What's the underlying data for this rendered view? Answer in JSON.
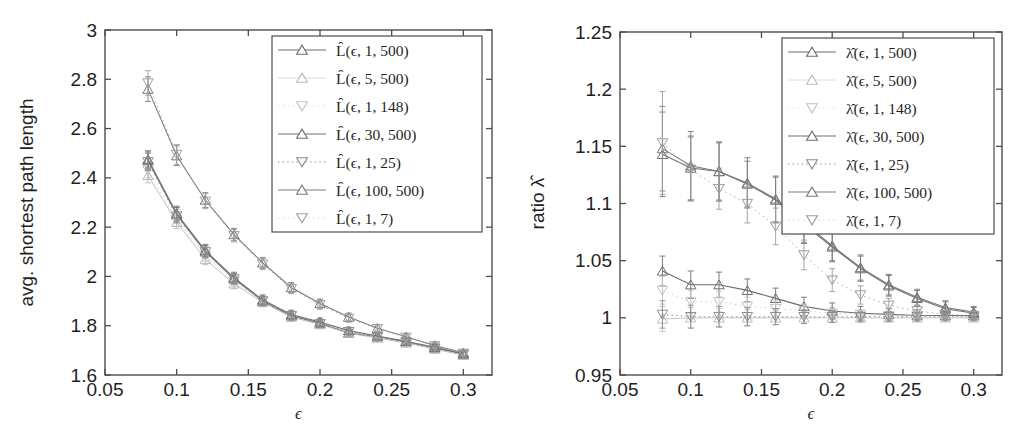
{
  "figure": {
    "panel_count": 2,
    "background": "#ffffff",
    "x_axis_symbol": "ϵ"
  },
  "chart_data": [
    {
      "type": "line",
      "panel": "left",
      "title": "",
      "xlabel": "ϵ",
      "ylabel": "avg. shortest path length",
      "xlim": [
        0.05,
        0.32
      ],
      "ylim": [
        1.6,
        3.0
      ],
      "xticks": [
        0.05,
        0.1,
        0.15,
        0.2,
        0.25,
        0.3
      ],
      "xticklabels": [
        "0.05",
        "0.1",
        "0.15",
        "0.2",
        "0.25",
        "0.3"
      ],
      "yticks": [
        1.6,
        1.8,
        2.0,
        2.2,
        2.4,
        2.6,
        2.8,
        3.0
      ],
      "yticklabels": [
        "1.6",
        "1.8",
        "2",
        "2.2",
        "2.4",
        "2.6",
        "2.8",
        "3"
      ],
      "grid": false,
      "legend_position": "upper-right",
      "errorbars": true,
      "x": [
        0.08,
        0.1,
        0.12,
        0.14,
        0.16,
        0.18,
        0.2,
        0.22,
        0.24,
        0.26,
        0.28,
        0.3
      ],
      "series": [
        {
          "name": "L̂(ϵ, 1, 500)",
          "marker": "triangle-up",
          "linestyle": "solid",
          "color": "#6e6e6e",
          "values": [
            2.47,
            2.25,
            2.1,
            1.99,
            1.9,
            1.84,
            1.81,
            1.77,
            1.755,
            1.735,
            1.71,
            1.685
          ],
          "errors": [
            0.035,
            0.03,
            0.025,
            0.022,
            0.02,
            0.018,
            0.016,
            0.014,
            0.013,
            0.012,
            0.011,
            0.01
          ]
        },
        {
          "name": "L̂(ϵ, 5, 500)",
          "marker": "triangle-up",
          "linestyle": "solid-faint",
          "color": "#b9b9b9",
          "values": [
            2.41,
            2.22,
            2.07,
            1.97,
            1.895,
            1.835,
            1.805,
            1.77,
            1.75,
            1.73,
            1.705,
            1.68
          ],
          "errors": [
            0.03,
            0.026,
            0.022,
            0.02,
            0.018,
            0.016,
            0.014,
            0.013,
            0.012,
            0.011,
            0.01,
            0.009
          ]
        },
        {
          "name": "L̂(ϵ, 1, 148)",
          "marker": "triangle-down",
          "linestyle": "dotted-faint",
          "color": "#c2c2c2",
          "values": [
            2.43,
            2.23,
            2.085,
            1.98,
            1.9,
            1.84,
            1.805,
            1.775,
            1.752,
            1.732,
            1.708,
            1.683
          ],
          "errors": [
            0.03,
            0.026,
            0.022,
            0.02,
            0.018,
            0.016,
            0.014,
            0.013,
            0.012,
            0.011,
            0.01,
            0.009
          ]
        },
        {
          "name": "L̂(ϵ, 30, 500)",
          "marker": "triangle-up",
          "linestyle": "solid",
          "color": "#707070",
          "values": [
            2.475,
            2.255,
            2.105,
            1.995,
            1.905,
            1.845,
            1.815,
            1.78,
            1.758,
            1.737,
            1.712,
            1.687
          ],
          "errors": [
            0.035,
            0.03,
            0.025,
            0.022,
            0.02,
            0.018,
            0.016,
            0.014,
            0.013,
            0.012,
            0.011,
            0.01
          ]
        },
        {
          "name": "L̂(ϵ, 1, 25)",
          "marker": "triangle-down",
          "linestyle": "dotted",
          "color": "#8c8c8c",
          "values": [
            2.465,
            2.245,
            2.1,
            1.99,
            1.9,
            1.84,
            1.808,
            1.776,
            1.754,
            1.734,
            1.709,
            1.684
          ],
          "errors": [
            0.035,
            0.028,
            0.024,
            0.021,
            0.019,
            0.017,
            0.015,
            0.014,
            0.012,
            0.011,
            0.01,
            0.009
          ]
        },
        {
          "name": "L̂(ϵ, 100, 500)",
          "marker": "triangle-up",
          "linestyle": "solid",
          "color": "#7a7a7a",
          "values": [
            2.76,
            2.49,
            2.31,
            2.17,
            2.055,
            1.955,
            1.89,
            1.835,
            1.79,
            1.755,
            1.72,
            1.69
          ],
          "errors": [
            0.05,
            0.04,
            0.03,
            0.025,
            0.022,
            0.02,
            0.018,
            0.016,
            0.014,
            0.012,
            0.011,
            0.01
          ]
        },
        {
          "name": "L̂(ϵ, 1, 7)",
          "marker": "triangle-down",
          "linestyle": "dotted-faint",
          "color": "#a0a0a0",
          "values": [
            2.785,
            2.495,
            2.305,
            2.165,
            2.05,
            1.95,
            1.885,
            1.83,
            1.788,
            1.753,
            1.718,
            1.688
          ],
          "errors": [
            0.05,
            0.04,
            0.03,
            0.025,
            0.022,
            0.02,
            0.018,
            0.016,
            0.014,
            0.012,
            0.011,
            0.01
          ]
        }
      ]
    },
    {
      "type": "line",
      "panel": "right",
      "title": "",
      "xlabel": "ϵ",
      "ylabel": "ratio λ̂",
      "xlim": [
        0.05,
        0.32
      ],
      "ylim": [
        0.95,
        1.25
      ],
      "xticks": [
        0.05,
        0.1,
        0.15,
        0.2,
        0.25,
        0.3
      ],
      "xticklabels": [
        "0.05",
        "0.1",
        "0.15",
        "0.2",
        "0.25",
        "0.3"
      ],
      "yticks": [
        0.95,
        1.0,
        1.05,
        1.1,
        1.15,
        1.2,
        1.25
      ],
      "yticklabels": [
        "0.95",
        "1",
        "1.05",
        "1.1",
        "1.15",
        "1.2",
        "1.25"
      ],
      "grid": false,
      "legend_position": "upper-right",
      "errorbars": true,
      "x": [
        0.08,
        0.1,
        0.12,
        0.14,
        0.16,
        0.18,
        0.2,
        0.22,
        0.24,
        0.26,
        0.28,
        0.3
      ],
      "series": [
        {
          "name": "λ̂(ϵ, 1, 500)",
          "marker": "triangle-up",
          "linestyle": "solid",
          "color": "#6e6e6e",
          "values": [
            1.041,
            1.029,
            1.029,
            1.024,
            1.017,
            1.01,
            1.006,
            1.004,
            1.003,
            1.002,
            1.002,
            1.002
          ],
          "errors": [
            0.013,
            0.012,
            0.011,
            0.01,
            0.009,
            0.008,
            0.007,
            0.006,
            0.005,
            0.005,
            0.004,
            0.004
          ]
        },
        {
          "name": "λ̂(ϵ, 5, 500)",
          "marker": "triangle-up",
          "linestyle": "solid-faint",
          "color": "#bdbdbd",
          "values": [
            0.999,
            1.0,
            1.0,
            1.0,
            1.0,
            1.0,
            1.0,
            1.0,
            1.0,
            1.0,
            1.0,
            1.0
          ],
          "errors": [
            0.011,
            0.009,
            0.008,
            0.007,
            0.006,
            0.005,
            0.004,
            0.004,
            0.003,
            0.003,
            0.003,
            0.003
          ]
        },
        {
          "name": "λ̂(ϵ, 1, 148)",
          "marker": "triangle-down",
          "linestyle": "dotted-faint",
          "color": "#c4c4c4",
          "values": [
            1.024,
            1.014,
            1.014,
            1.01,
            1.008,
            1.006,
            1.004,
            1.003,
            1.002,
            1.002,
            1.001,
            1.001
          ],
          "errors": [
            0.012,
            0.01,
            0.009,
            0.008,
            0.007,
            0.006,
            0.005,
            0.004,
            0.004,
            0.003,
            0.003,
            0.003
          ]
        },
        {
          "name": "λ̂(ϵ, 30, 500)",
          "marker": "triangle-up",
          "linestyle": "solid",
          "color": "#707070",
          "values": [
            1.143,
            1.131,
            1.128,
            1.117,
            1.103,
            1.082,
            1.062,
            1.043,
            1.028,
            1.017,
            1.008,
            1.004
          ],
          "errors": [
            0.037,
            0.028,
            0.025,
            0.02,
            0.02,
            0.017,
            0.013,
            0.011,
            0.009,
            0.007,
            0.006,
            0.005
          ]
        },
        {
          "name": "λ̂(ϵ, 1, 25)",
          "marker": "triangle-down",
          "linestyle": "dotted",
          "color": "#8c8c8c",
          "values": [
            1.003,
            1.001,
            1.001,
            1.001,
            1.001,
            1.001,
            1.001,
            1.001,
            1.001,
            1.001,
            1.001,
            1.001
          ],
          "errors": [
            0.012,
            0.01,
            0.009,
            0.008,
            0.007,
            0.006,
            0.005,
            0.004,
            0.004,
            0.003,
            0.003,
            0.003
          ]
        },
        {
          "name": "λ̂(ϵ, 100, 500)",
          "marker": "triangle-up",
          "linestyle": "solid",
          "color": "#7a7a7a",
          "values": [
            1.148,
            1.133,
            1.128,
            1.118,
            1.104,
            1.083,
            1.063,
            1.044,
            1.029,
            1.018,
            1.009,
            1.005
          ],
          "errors": [
            0.037,
            0.03,
            0.026,
            0.022,
            0.02,
            0.017,
            0.013,
            0.011,
            0.009,
            0.007,
            0.006,
            0.005
          ]
        },
        {
          "name": "λ̂(ϵ, 1, 7)",
          "marker": "triangle-down",
          "linestyle": "dotted-faint",
          "color": "#9c9c9c",
          "values": [
            1.153,
            1.13,
            1.113,
            1.1,
            1.08,
            1.055,
            1.033,
            1.02,
            1.011,
            1.006,
            1.003,
            1.002
          ],
          "errors": [
            0.045,
            0.028,
            0.018,
            0.017,
            0.016,
            0.013,
            0.01,
            0.008,
            0.006,
            0.005,
            0.004,
            0.004
          ]
        }
      ]
    }
  ]
}
